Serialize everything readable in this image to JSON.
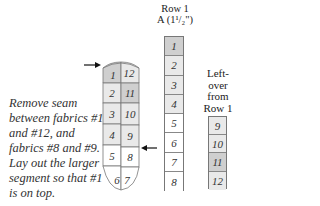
{
  "caption": "Remove seam between fabrics #1 and #12, and fabrics #8 and #9. Lay out the larger segment so that #1 is on top.",
  "row1": {
    "title": "Row 1",
    "subtitle": "A (1¹/₂\")",
    "cells": [
      {
        "n": "1",
        "shade": "shade"
      },
      {
        "n": "2",
        "shade": "light"
      },
      {
        "n": "3",
        "shade": "light"
      },
      {
        "n": "4",
        "shade": "light"
      },
      {
        "n": "5",
        "shade": "white"
      },
      {
        "n": "6",
        "shade": "white"
      },
      {
        "n": "7",
        "shade": "white"
      },
      {
        "n": "8",
        "shade": "white"
      }
    ]
  },
  "leftover": {
    "title_lines": [
      "Left-",
      "over",
      "from",
      "Row 1"
    ],
    "cells": [
      {
        "n": "9",
        "shade": "light"
      },
      {
        "n": "10",
        "shade": "light"
      },
      {
        "n": "11",
        "shade": "shade"
      },
      {
        "n": "12",
        "shade": "light"
      }
    ]
  },
  "loop": {
    "left_labels": [
      "1",
      "2",
      "3",
      "4",
      "5",
      "6"
    ],
    "right_labels": [
      "12",
      "11",
      "10",
      "9",
      "8",
      "7"
    ],
    "arrows": [
      "arrow-seam-1-12",
      "arrow-seam-8-9"
    ]
  },
  "colors": {
    "shade": "#cfcfcf",
    "light": "#e9e9e9",
    "line": "#777777"
  }
}
